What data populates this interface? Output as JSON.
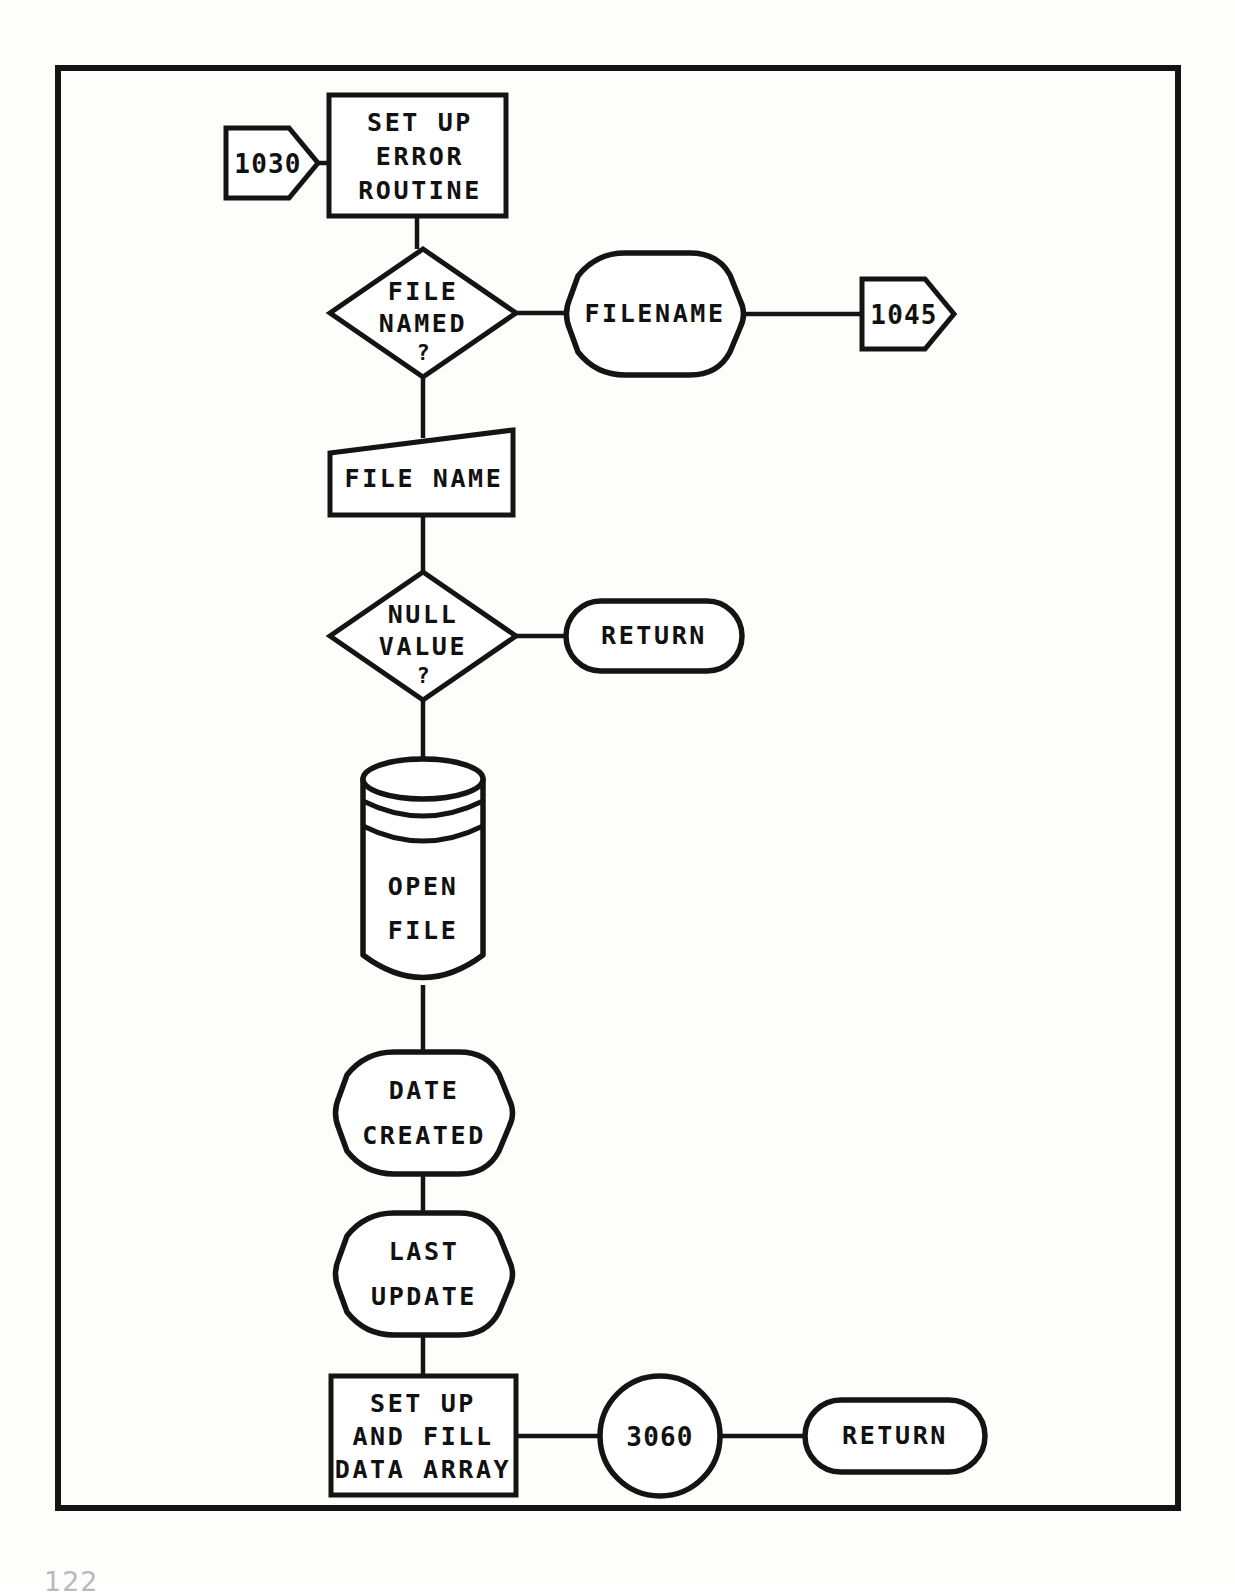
{
  "document": {
    "type": "flowchart",
    "page_number": "122",
    "border": {
      "x": 58,
      "y": 68,
      "width": 1120,
      "height": 1440,
      "color": "#141414"
    }
  },
  "diagram": {
    "nodes": [
      {
        "id": "conn-1030",
        "shape": "connector-pentagon-right",
        "label": "1030",
        "lines": [
          "1030"
        ],
        "x": 226,
        "y": 128,
        "width": 92,
        "height": 70
      },
      {
        "id": "setup-error-routine",
        "shape": "process-rectangle",
        "label": "SET UP ERROR ROUTINE",
        "lines": [
          "SET UP",
          "ERROR",
          "ROUTINE"
        ],
        "x": 329,
        "y": 95,
        "width": 177,
        "height": 121
      },
      {
        "id": "file-named-decision",
        "shape": "decision-diamond",
        "label": "FILE NAMED ?",
        "lines": [
          "FILE",
          "NAMED",
          "?"
        ],
        "x": 330,
        "y": 249,
        "width": 186,
        "height": 128
      },
      {
        "id": "filename-display",
        "shape": "display",
        "label": "FILENAME",
        "lines": [
          "FILENAME"
        ],
        "x": 568,
        "y": 253,
        "width": 172,
        "height": 122
      },
      {
        "id": "conn-1045",
        "shape": "connector-pentagon-right",
        "label": "1045",
        "lines": [
          "1045"
        ],
        "x": 862,
        "y": 279,
        "width": 92,
        "height": 70
      },
      {
        "id": "file-name-input",
        "shape": "manual-input-trapezoid",
        "label": "FILE NAME",
        "lines": [
          "FILE NAME"
        ],
        "x": 330,
        "y": 430,
        "width": 183,
        "height": 85
      },
      {
        "id": "null-value-decision",
        "shape": "decision-diamond",
        "label": "NULL VALUE ?",
        "lines": [
          "NULL",
          "VALUE",
          "?"
        ],
        "x": 330,
        "y": 572,
        "width": 186,
        "height": 128
      },
      {
        "id": "return-1",
        "shape": "terminator-stadium",
        "label": "RETURN",
        "lines": [
          "RETURN"
        ],
        "x": 566,
        "y": 601,
        "width": 176,
        "height": 70
      },
      {
        "id": "open-file-storage",
        "shape": "cylinder-storage",
        "label": "OPEN FILE",
        "lines": [
          "OPEN",
          "FILE"
        ],
        "x": 363,
        "y": 760,
        "width": 123,
        "height": 225
      },
      {
        "id": "date-created-display",
        "shape": "display",
        "label": "DATE CREATED",
        "lines": [
          "DATE",
          "CREATED"
        ],
        "x": 337,
        "y": 1052,
        "width": 172,
        "height": 122
      },
      {
        "id": "last-update-display",
        "shape": "display",
        "label": "LAST UPDATE",
        "lines": [
          "LAST",
          "UPDATE"
        ],
        "x": 337,
        "y": 1213,
        "width": 172,
        "height": 122
      },
      {
        "id": "setup-fill-data-array",
        "shape": "process-rectangle",
        "label": "SET UP AND FILL DATA ARRAY",
        "lines": [
          "SET UP",
          "AND FILL",
          "DATA ARRAY"
        ],
        "x": 331,
        "y": 1376,
        "width": 185,
        "height": 119
      },
      {
        "id": "conn-3060",
        "shape": "connector-circle",
        "label": "3060",
        "lines": [
          "3060"
        ],
        "x": 600,
        "y": 1376,
        "width": 120,
        "height": 119
      },
      {
        "id": "return-2",
        "shape": "terminator-stadium",
        "label": "RETURN",
        "lines": [
          "RETURN"
        ],
        "x": 805,
        "y": 1400,
        "width": 180,
        "height": 72
      }
    ],
    "edges": [
      {
        "from": "conn-1030",
        "to": "setup-error-routine",
        "direction": "right"
      },
      {
        "from": "setup-error-routine",
        "to": "file-named-decision",
        "direction": "down"
      },
      {
        "from": "file-named-decision",
        "to": "filename-display",
        "direction": "right"
      },
      {
        "from": "filename-display",
        "to": "conn-1045",
        "direction": "right"
      },
      {
        "from": "file-named-decision",
        "to": "file-name-input",
        "direction": "down"
      },
      {
        "from": "file-name-input",
        "to": "null-value-decision",
        "direction": "down"
      },
      {
        "from": "null-value-decision",
        "to": "return-1",
        "direction": "right"
      },
      {
        "from": "null-value-decision",
        "to": "open-file-storage",
        "direction": "down"
      },
      {
        "from": "open-file-storage",
        "to": "date-created-display",
        "direction": "down"
      },
      {
        "from": "date-created-display",
        "to": "last-update-display",
        "direction": "down"
      },
      {
        "from": "last-update-display",
        "to": "setup-fill-data-array",
        "direction": "down"
      },
      {
        "from": "setup-fill-data-array",
        "to": "conn-3060",
        "direction": "right"
      },
      {
        "from": "conn-3060",
        "to": "return-2",
        "direction": "right"
      }
    ]
  }
}
